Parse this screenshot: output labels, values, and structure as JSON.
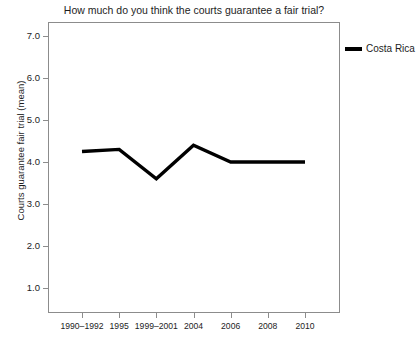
{
  "chart_data": {
    "type": "line",
    "title": "How much do you think the courts guarantee a fair trial?",
    "xlabel": "",
    "ylabel": "Courts guarantee fair trial (mean)",
    "categories": [
      "1990–1992",
      "1995",
      "1999–2001",
      "2004",
      "2006",
      "2008",
      "2010"
    ],
    "series": [
      {
        "name": "Costa Rica",
        "color": "#000000",
        "values": [
          4.25,
          4.3,
          3.6,
          4.4,
          4.0,
          4.0,
          4.0
        ]
      }
    ],
    "ylim": [
      1.0,
      7.0
    ],
    "yticks": [
      "1.0",
      "2.0",
      "3.0",
      "4.0",
      "5.0",
      "6.0",
      "7.0"
    ],
    "ytick_values": [
      1.0,
      2.0,
      3.0,
      4.0,
      5.0,
      6.0,
      7.0
    ],
    "grid": false,
    "legend_position": "right-top",
    "legend_entries": [
      "Costa Rica"
    ]
  },
  "legend": {
    "items": [
      {
        "label": "Costa Rica",
        "color": "#000000"
      }
    ]
  }
}
